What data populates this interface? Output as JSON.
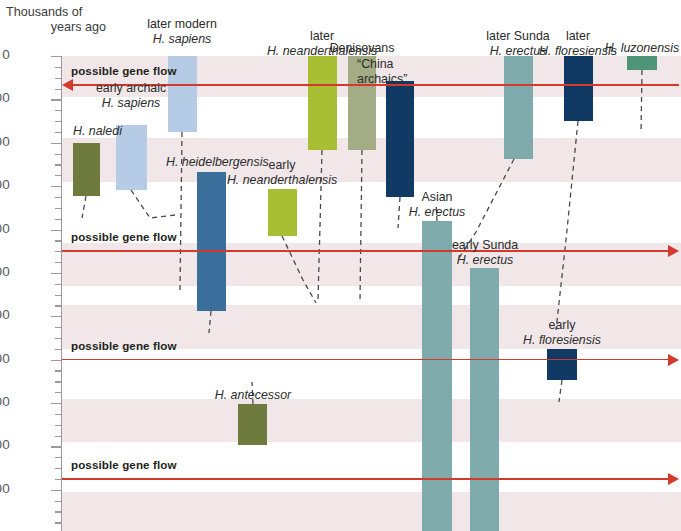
{
  "axis": {
    "title_line1": "Thousands of",
    "title_line2": "years ago",
    "ticks": [
      "0",
      "100",
      "200",
      "300",
      "400",
      "500",
      "600",
      "700",
      "800",
      "900",
      "1000"
    ],
    "unit": "thousands of years ago",
    "min": 0,
    "max": 1095
  },
  "colors": {
    "band": "#f1e7e9",
    "arrow": "#d33a2c",
    "olive": "#6e7a3e",
    "light_blue": "#b6cbe6",
    "steel_blue": "#3a6f9b",
    "yellow_green": "#a8bf34",
    "sage": "#a3ac85",
    "navy": "#103a63",
    "teal": "#7fabac",
    "green": "#4d9478",
    "axis": "#9a9a9a",
    "text": "#2b2b2b"
  },
  "gene_flow": [
    {
      "label": "possible gene flow",
      "at_kyr": 68,
      "direction": "left"
    },
    {
      "label": "possible gene flow",
      "at_kyr": 450,
      "direction": "right"
    },
    {
      "label": "possible gene flow",
      "at_kyr": 700,
      "direction": "right"
    },
    {
      "label": "possible gene flow",
      "at_kyr": 975,
      "direction": "right"
    }
  ],
  "chart_data": {
    "type": "bar",
    "title": "",
    "xlabel": "",
    "ylabel": "Thousands of years ago",
    "ylim": [
      0,
      1095
    ],
    "orientation": "vertical-range-bars",
    "axis_inverted": true,
    "grid": "horizontal alternating pink bands",
    "legend": "none",
    "categories": [
      "H. naledi",
      "early archaic H. sapiens",
      "later modern H. sapiens",
      "H. heidelbergensis",
      "early H. neanderthalensis",
      "later H. neanderthalensis",
      "Denisovans",
      "“China archaics”",
      "Asian H. erectus",
      "early Sunda H. erectus",
      "later Sunda H. erectus",
      "early H. floresiensis",
      "later H. floresiensis",
      "H. luzonensis",
      "H. antecessor"
    ],
    "ranges_kyr": [
      [
        200,
        325
      ],
      [
        165,
        320
      ],
      [
        0,
        172
      ],
      [
        300,
        620
      ],
      [
        305,
        415
      ],
      [
        0,
        215
      ],
      [
        0,
        215
      ],
      [
        57,
        365
      ],
      [
        380,
        1095
      ],
      [
        487,
        1095
      ],
      [
        0,
        237
      ],
      [
        690,
        760
      ],
      [
        0,
        150
      ],
      [
        0,
        32
      ],
      [
        800,
        897
      ]
    ],
    "bars": [
      {
        "name": "H. naledi",
        "label_lines": [
          {
            "t": "H. naledi",
            "style": "italic"
          }
        ],
        "x": 73,
        "w": 27,
        "top": 143,
        "h": 53,
        "color": "#6e7a3e",
        "label_x": 73,
        "label_y": 124,
        "label_align": "l",
        "connector": [
          {
            "x": 86,
            "y": 196
          },
          {
            "x": 82,
            "y": 218
          }
        ]
      },
      {
        "name": "early archaic H. sapiens",
        "label_lines": [
          {
            "t": "early archaic",
            "style": "normal"
          },
          {
            "t": "H. sapiens",
            "style": "italic"
          }
        ],
        "x": 116,
        "w": 31,
        "top": 125,
        "h": 65,
        "color": "#b6cbe6",
        "label_x": 131,
        "label_y": 81,
        "label_align": "c",
        "connector": [
          {
            "x": 131,
            "y": 190
          },
          {
            "x": 150,
            "y": 218
          },
          {
            "x": 175,
            "y": 215
          }
        ]
      },
      {
        "name": "later modern H. sapiens",
        "label_lines": [
          {
            "t": "later modern",
            "style": "normal"
          },
          {
            "t": "H. sapiens",
            "style": "italic"
          }
        ],
        "x": 168,
        "w": 29,
        "top": 56,
        "h": 76,
        "color": "#b6cbe6",
        "label_x": 182,
        "label_y": 17,
        "label_align": "c",
        "connector": [
          {
            "x": 182,
            "y": 132
          },
          {
            "x": 180,
            "y": 290
          }
        ]
      },
      {
        "name": "H. heidelbergensis",
        "label_lines": [
          {
            "t": "H. heidelbergensis",
            "style": "italic"
          }
        ],
        "x": 197,
        "w": 29,
        "top": 172,
        "h": 139,
        "color": "#3a6f9b",
        "label_x": 166,
        "label_y": 155,
        "label_align": "l",
        "connector": [
          {
            "x": 211,
            "y": 311
          },
          {
            "x": 209,
            "y": 333
          }
        ]
      },
      {
        "name": "early H. neanderthalensis",
        "label_lines": [
          {
            "t": "early",
            "style": "normal"
          },
          {
            "t": "H. neanderthalensis",
            "style": "italic"
          }
        ],
        "x": 268,
        "w": 29,
        "top": 189,
        "h": 47,
        "color": "#a8bf34",
        "label_x": 282,
        "label_y": 158,
        "label_align": "c",
        "connector": [
          {
            "x": 282,
            "y": 236
          },
          {
            "x": 303,
            "y": 280
          },
          {
            "x": 316,
            "y": 303
          }
        ]
      },
      {
        "name": "later H. neanderthalensis",
        "label_lines": [
          {
            "t": "later",
            "style": "normal"
          },
          {
            "t": "H. neanderthalensis",
            "style": "italic"
          }
        ],
        "x": 308,
        "w": 29,
        "top": 56,
        "h": 94,
        "color": "#a8bf34",
        "label_x": 322,
        "label_y": 29,
        "label_align": "c",
        "connector": [
          {
            "x": 322,
            "y": 150
          },
          {
            "x": 318,
            "y": 300
          }
        ]
      },
      {
        "name": "Denisovans",
        "label_lines": [
          {
            "t": "Denisovans",
            "style": "normal"
          }
        ],
        "x": 348,
        "w": 28,
        "top": 56,
        "h": 94,
        "color": "#a3ac85",
        "label_x": 362,
        "label_y": 41,
        "label_align": "c",
        "connector": [
          {
            "x": 362,
            "y": 150
          },
          {
            "x": 360,
            "y": 300
          }
        ]
      },
      {
        "name": "China archaics",
        "label_lines": [
          {
            "t": "“China",
            "style": "normal"
          },
          {
            "t": "archaics”",
            "style": "normal"
          }
        ],
        "x": 386,
        "w": 28,
        "top": 81,
        "h": 116,
        "color": "#103a63",
        "label_x": 357,
        "label_y": 57,
        "label_align": "l",
        "connector": [
          {
            "x": 400,
            "y": 197
          },
          {
            "x": 398,
            "y": 228
          }
        ]
      },
      {
        "name": "Asian H. erectus",
        "label_lines": [
          {
            "t": "Asian",
            "style": "normal"
          },
          {
            "t": "H. erectus",
            "style": "italic"
          }
        ],
        "x": 422,
        "w": 30,
        "top": 221,
        "h": 310,
        "color": "#7fabac",
        "label_x": 437,
        "label_y": 190,
        "label_align": "c",
        "connector": [
          {
            "x": 437,
            "y": 221
          },
          {
            "x": 436,
            "y": 203
          }
        ]
      },
      {
        "name": "early Sunda H. erectus",
        "label_lines": [
          {
            "t": "early Sunda",
            "style": "normal"
          },
          {
            "t": "H. erectus",
            "style": "italic"
          }
        ],
        "x": 470,
        "w": 29,
        "top": 268,
        "h": 263,
        "color": "#7fabac",
        "label_x": 485,
        "label_y": 238,
        "label_align": "c",
        "connector": []
      },
      {
        "name": "later Sunda H. erectus",
        "label_lines": [
          {
            "t": "later Sunda",
            "style": "normal"
          },
          {
            "t": "H. erectus",
            "style": "italic"
          }
        ],
        "x": 504,
        "w": 29,
        "top": 56,
        "h": 103,
        "color": "#7fabac",
        "label_x": 518,
        "label_y": 29,
        "label_align": "c",
        "connector": [
          {
            "x": 514,
            "y": 159
          },
          {
            "x": 476,
            "y": 232
          },
          {
            "x": 459,
            "y": 258
          }
        ]
      },
      {
        "name": "early H. floresiensis",
        "label_lines": [
          {
            "t": "early",
            "style": "normal"
          },
          {
            "t": "H. floresiensis",
            "style": "italic"
          }
        ],
        "x": 547,
        "w": 30,
        "top": 349,
        "h": 31,
        "color": "#103a63",
        "label_x": 562,
        "label_y": 318,
        "label_align": "c",
        "connector": [
          {
            "x": 562,
            "y": 380
          },
          {
            "x": 559,
            "y": 402
          }
        ]
      },
      {
        "name": "later H. floresiensis",
        "label_lines": [
          {
            "t": "later",
            "style": "normal"
          },
          {
            "t": "H. floresiensis",
            "style": "italic"
          }
        ],
        "x": 564,
        "w": 29,
        "top": 56,
        "h": 65,
        "color": "#103a63",
        "label_x": 578,
        "label_y": 29,
        "label_align": "c",
        "connector": [
          {
            "x": 578,
            "y": 121
          },
          {
            "x": 566,
            "y": 240
          },
          {
            "x": 556,
            "y": 330
          }
        ]
      },
      {
        "name": "H. luzonensis",
        "label_lines": [
          {
            "t": "H. luzonensis",
            "style": "italic"
          }
        ],
        "x": 627,
        "w": 30,
        "top": 56,
        "h": 14,
        "color": "#4d9478",
        "label_x": 642,
        "label_y": 41,
        "label_align": "c",
        "connector": [
          {
            "x": 642,
            "y": 70
          },
          {
            "x": 641,
            "y": 133
          }
        ]
      },
      {
        "name": "H. antecessor",
        "label_lines": [
          {
            "t": "H. antecessor",
            "style": "italic"
          }
        ],
        "x": 238,
        "w": 29,
        "top": 404,
        "h": 41,
        "color": "#6e7a3e",
        "label_x": 253,
        "label_y": 388,
        "label_align": "c",
        "connector": [
          {
            "x": 253,
            "y": 404
          },
          {
            "x": 252,
            "y": 382
          }
        ]
      }
    ]
  }
}
